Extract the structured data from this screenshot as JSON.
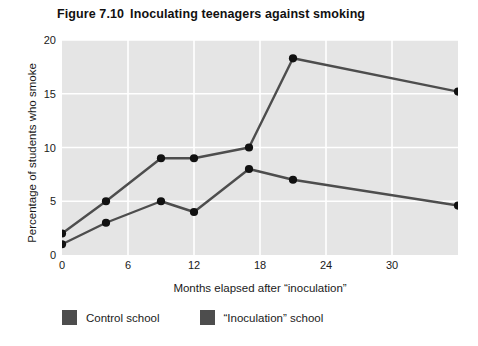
{
  "figure": {
    "number": "Figure 7.10",
    "title": "Inoculating teenagers against smoking"
  },
  "legend": {
    "position": "below-plot",
    "swatch_color": "#4d4d4d",
    "items": [
      {
        "label": "Control school",
        "color": "#4d4d4d"
      },
      {
        "label": "“Inoculation” school",
        "color": "#4d4d4d"
      }
    ]
  },
  "axes": {
    "x_label": "Months elapsed after “inoculation”",
    "y_label": "Percentage of students who smoke",
    "x_ticks": [
      "0",
      "6",
      "12",
      "18",
      "24",
      "30"
    ],
    "y_ticks": [
      "0",
      "5",
      "10",
      "15",
      "20"
    ]
  },
  "style": {
    "plot_background": "#e5e5e5",
    "gridline_color": "#ffffff",
    "line_color": "#4d4d4d",
    "marker_color": "#111111",
    "page_background": "#ffffff"
  },
  "chart_data": {
    "type": "line",
    "title": "Inoculating teenagers against smoking",
    "xlabel": "Months elapsed after “inoculation”",
    "ylabel": "Percentage of students who smoke",
    "xlim": [
      0,
      36
    ],
    "ylim": [
      0,
      20
    ],
    "x_ticks": [
      0,
      6,
      12,
      18,
      24,
      30
    ],
    "y_ticks": [
      0,
      5,
      10,
      15,
      20
    ],
    "grid": true,
    "legend_position": "bottom-left",
    "series": [
      {
        "name": "Control school",
        "color": "#4d4d4d",
        "x": [
          0,
          4,
          9,
          12,
          17,
          21,
          36
        ],
        "y": [
          2.0,
          5.0,
          9.0,
          9.0,
          10.0,
          18.3,
          15.2
        ]
      },
      {
        "name": "“Inoculation” school",
        "color": "#4d4d4d",
        "x": [
          0,
          4,
          9,
          12,
          17,
          21,
          36
        ],
        "y": [
          1.0,
          3.0,
          5.0,
          4.0,
          8.0,
          7.0,
          4.6
        ]
      }
    ]
  }
}
